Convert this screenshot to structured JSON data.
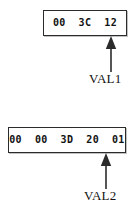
{
  "diagram": {
    "type": "byte-sequence-annotation",
    "background_color": "#ffffff",
    "line_color": "#2b2b2b",
    "text_color": "#121212",
    "groups": [
      {
        "id": "val1",
        "bytes_text": "00  3C  12",
        "bytes": [
          "00",
          "3C",
          "12"
        ],
        "byte_count": 3,
        "label": "VAL1",
        "arrow_points_to": "last-byte",
        "arrow_direction": "up"
      },
      {
        "id": "val2",
        "bytes_text": "00  00  3D  20  01",
        "bytes": [
          "00",
          "00",
          "3D",
          "20",
          "01"
        ],
        "byte_count": 5,
        "label": "VAL2",
        "arrow_points_to": "last-byte",
        "arrow_direction": "up"
      }
    ]
  }
}
